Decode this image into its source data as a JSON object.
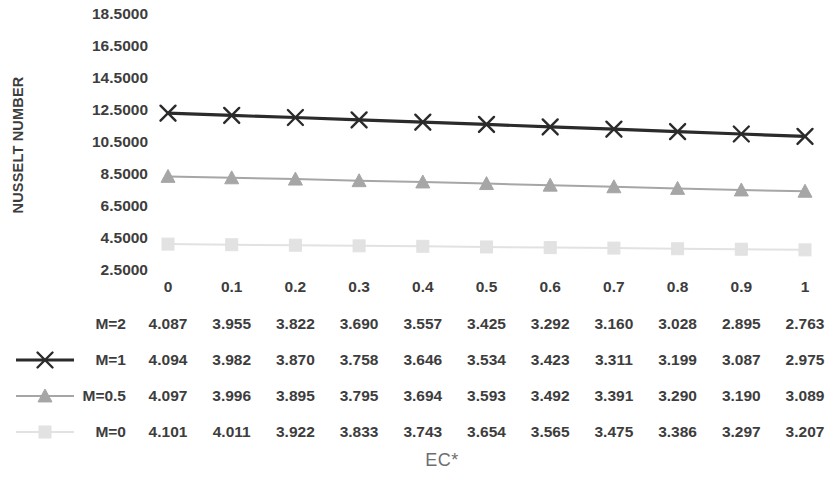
{
  "chart_data": {
    "type": "line",
    "title": "",
    "xlabel": "EC*",
    "ylabel": "NUSSELT NUMBER",
    "x": [
      0,
      0.1,
      0.2,
      0.3,
      0.4,
      0.5,
      0.6,
      0.7,
      0.8,
      0.9,
      1
    ],
    "xtick_labels": [
      "0",
      "0.1",
      "0.2",
      "0.3",
      "0.4",
      "0.5",
      "0.6",
      "0.7",
      "0.8",
      "0.9",
      "1"
    ],
    "ytick_labels": [
      "18.5000",
      "16.5000",
      "14.5000",
      "12.5000",
      "10.5000",
      "8.5000",
      "6.5000",
      "4.5000",
      "2.5000"
    ],
    "ytick_values": [
      18.5,
      16.5,
      14.5,
      12.5,
      10.5,
      8.5,
      6.5,
      4.5,
      2.5
    ],
    "ylim": [
      2.5,
      18.5
    ],
    "xlim": [
      0,
      1
    ],
    "grid": false,
    "legend_position": "bottom-left-table",
    "series": [
      {
        "name": "M=2",
        "color": "#ffffff",
        "marker": "none",
        "plotted": false,
        "values": [
          4.087,
          3.955,
          3.822,
          3.69,
          3.557,
          3.425,
          3.292,
          3.16,
          3.028,
          2.895,
          2.763
        ]
      },
      {
        "name": "M=1",
        "color": "#2b2b2b",
        "marker": "x",
        "plotted": true,
        "values": [
          4.094,
          3.982,
          3.87,
          3.758,
          3.646,
          3.534,
          3.423,
          3.311,
          3.199,
          3.087,
          2.975
        ],
        "plot_values": [
          12.3,
          12.16,
          12.03,
          11.88,
          11.74,
          11.6,
          11.44,
          11.3,
          11.15,
          11.0,
          10.85
        ]
      },
      {
        "name": "M=0.5",
        "color": "#a6a6a6",
        "marker": "triangle",
        "plotted": true,
        "values": [
          4.097,
          3.996,
          3.895,
          3.795,
          3.694,
          3.593,
          3.492,
          3.391,
          3.29,
          3.19,
          3.089
        ],
        "plot_values": [
          8.35,
          8.26,
          8.18,
          8.08,
          8.0,
          7.9,
          7.8,
          7.7,
          7.6,
          7.5,
          7.42
        ]
      },
      {
        "name": "M=0",
        "color": "#e2e2e2",
        "marker": "square",
        "plotted": true,
        "values": [
          4.101,
          4.011,
          3.922,
          3.833,
          3.743,
          3.654,
          3.565,
          3.475,
          3.386,
          3.297,
          3.207
        ],
        "plot_values": [
          4.12,
          4.08,
          4.05,
          4.01,
          3.98,
          3.94,
          3.9,
          3.87,
          3.83,
          3.8,
          3.76
        ]
      }
    ]
  },
  "axes": {
    "y_title": "NUSSELT NUMBER",
    "x_title": "EC*"
  },
  "table": {
    "column_headers": [
      "0",
      "0.1",
      "0.2",
      "0.3",
      "0.4",
      "0.5",
      "0.6",
      "0.7",
      "0.8",
      "0.9",
      "1"
    ],
    "rows": [
      {
        "label": "M=2",
        "values": [
          "4.087",
          "3.955",
          "3.822",
          "3.690",
          "3.557",
          "3.425",
          "3.292",
          "3.160",
          "3.028",
          "2.895",
          "2.763"
        ]
      },
      {
        "label": "M=1",
        "values": [
          "4.094",
          "3.982",
          "3.870",
          "3.758",
          "3.646",
          "3.534",
          "3.423",
          "3.311",
          "3.199",
          "3.087",
          "2.975"
        ]
      },
      {
        "label": "M=0.5",
        "values": [
          "4.097",
          "3.996",
          "3.895",
          "3.795",
          "3.694",
          "3.593",
          "3.492",
          "3.391",
          "3.290",
          "3.190",
          "3.089"
        ]
      },
      {
        "label": "M=0",
        "values": [
          "4.101",
          "4.011",
          "3.922",
          "3.833",
          "3.743",
          "3.654",
          "3.565",
          "3.475",
          "3.386",
          "3.297",
          "3.207"
        ]
      }
    ]
  },
  "colors": {
    "series_m1": "#2b2b2b",
    "series_m05": "#a6a6a6",
    "series_m0": "#e2e2e2",
    "text": "#3d3d3d",
    "axis_title": "#6e6e6e",
    "background": "#ffffff"
  }
}
